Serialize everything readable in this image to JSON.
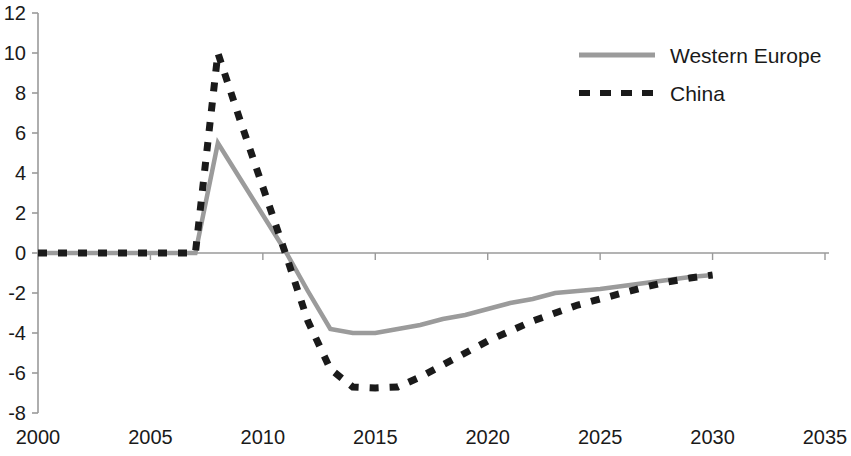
{
  "chart_data": {
    "type": "line",
    "title": "",
    "xlabel": "",
    "ylabel": "",
    "xlim": [
      2000,
      2035
    ],
    "ylim": [
      -8,
      12
    ],
    "grid": false,
    "legend_position": "top-right",
    "x_ticks": [
      "2000",
      "2005",
      "2010",
      "2015",
      "2020",
      "2025",
      "2030",
      "2035"
    ],
    "x_tick_values": [
      2000,
      2005,
      2010,
      2015,
      2020,
      2025,
      2030,
      2035
    ],
    "y_ticks": [
      "12",
      "10",
      "8",
      "6",
      "4",
      "2",
      "0",
      "-2",
      "-4",
      "-6",
      "-8"
    ],
    "y_tick_values": [
      12,
      10,
      8,
      6,
      4,
      2,
      0,
      -2,
      -4,
      -6,
      -8
    ],
    "series": [
      {
        "name": "Western Europe",
        "color": "#9b9b9b",
        "style": "solid",
        "x": [
          2000,
          2001,
          2002,
          2003,
          2004,
          2005,
          2006,
          2007,
          2008,
          2009,
          2010,
          2011,
          2012,
          2013,
          2014,
          2015,
          2016,
          2017,
          2018,
          2019,
          2020,
          2021,
          2022,
          2023,
          2024,
          2025,
          2026,
          2027,
          2028,
          2029,
          2030
        ],
        "values": [
          0,
          0,
          0,
          0,
          0,
          0,
          0,
          0,
          5.5,
          3.7,
          1.9,
          0.1,
          -1.9,
          -3.8,
          -4.0,
          -4.0,
          -3.8,
          -3.6,
          -3.3,
          -3.1,
          -2.8,
          -2.5,
          -2.3,
          -2.0,
          -1.9,
          -1.8,
          -1.65,
          -1.5,
          -1.35,
          -1.2,
          -1.1
        ]
      },
      {
        "name": "China",
        "color": "#1a1a1a",
        "style": "dashed",
        "x": [
          2000,
          2001,
          2002,
          2003,
          2004,
          2005,
          2006,
          2007,
          2008,
          2009,
          2010,
          2011,
          2012,
          2013,
          2014,
          2015,
          2016,
          2017,
          2018,
          2019,
          2020,
          2021,
          2022,
          2023,
          2024,
          2025,
          2026,
          2027,
          2028,
          2029,
          2030
        ],
        "values": [
          0,
          0,
          0,
          0,
          0,
          0,
          0,
          0,
          10.0,
          6.6,
          3.3,
          0.0,
          -3.4,
          -5.8,
          -6.7,
          -6.75,
          -6.7,
          -6.2,
          -5.6,
          -5.0,
          -4.4,
          -3.9,
          -3.4,
          -3.0,
          -2.6,
          -2.3,
          -2.0,
          -1.7,
          -1.45,
          -1.25,
          -1.1
        ]
      }
    ]
  },
  "legend": {
    "items": [
      {
        "label": "Western Europe",
        "color": "#9b9b9b",
        "style": "solid"
      },
      {
        "label": "China",
        "color": "#1a1a1a",
        "style": "dashed"
      }
    ]
  }
}
